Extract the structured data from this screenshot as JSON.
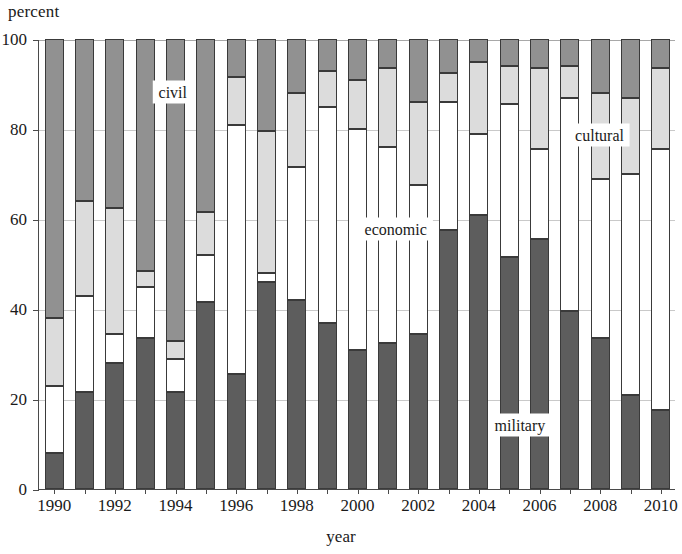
{
  "chart_data": {
    "type": "bar",
    "subtype": "stacked-bar-100-percent",
    "title": "",
    "xlabel": "year",
    "ylabel": "percent",
    "ylim": [
      0,
      100
    ],
    "yticks": [
      0,
      20,
      40,
      60,
      80,
      100
    ],
    "ytick_labels": [
      "0",
      "20",
      "40",
      "60",
      "80",
      "100"
    ],
    "grid": "horizontal",
    "legend_position": "in-plot annotations",
    "categories": [
      "1990",
      "1991",
      "1992",
      "1993",
      "1994",
      "1995",
      "1996",
      "1997",
      "1998",
      "1999",
      "2000",
      "2001",
      "2002",
      "2003",
      "2004",
      "2005",
      "2006",
      "2007",
      "2008",
      "2009",
      "2010"
    ],
    "xtick_labels": [
      "1990",
      "1992",
      "1994",
      "1996",
      "1998",
      "2000",
      "2002",
      "2004",
      "2006",
      "2008",
      "2010"
    ],
    "series": [
      {
        "name": "military",
        "color": "#5d5d5d",
        "values": [
          8,
          21.5,
          28,
          33.5,
          21.5,
          41.5,
          25.5,
          46,
          42,
          37,
          31,
          32.5,
          34.5,
          57.5,
          61,
          51.5,
          55.5,
          39.5,
          33.5,
          21,
          17.5
        ]
      },
      {
        "name": "economic",
        "color": "#ffffff",
        "values": [
          15,
          21.5,
          6.5,
          11.5,
          7.5,
          10.5,
          55.5,
          2,
          29.5,
          48,
          49,
          43.5,
          33,
          28.5,
          18,
          34,
          20,
          47.5,
          35.5,
          49,
          58
        ]
      },
      {
        "name": "cultural",
        "color": "#dcdcdc",
        "values": [
          15,
          21,
          28,
          3.5,
          4,
          9.5,
          10.5,
          31.5,
          16.5,
          8,
          11,
          17.5,
          18.5,
          6.5,
          16,
          8.5,
          18,
          7,
          19,
          17,
          18
        ]
      },
      {
        "name": "civil",
        "color": "#919191",
        "values": [
          62,
          36,
          37.5,
          51.5,
          67,
          38.5,
          8.5,
          20.5,
          12,
          7,
          9,
          6.5,
          14,
          7.5,
          5,
          6,
          6.5,
          6,
          12,
          13,
          6.5
        ]
      }
    ],
    "cumulative_tops": {
      "military": [
        8,
        21.5,
        28,
        33.5,
        21.5,
        41.5,
        25.5,
        46,
        42,
        37,
        31,
        32.5,
        34.5,
        57.5,
        61,
        51.5,
        55.5,
        39.5,
        33.5,
        21,
        17.5
      ],
      "economic": [
        23,
        43,
        34.5,
        45,
        29,
        52,
        81,
        48,
        71.5,
        85,
        80,
        76,
        67.5,
        86,
        79,
        85.5,
        75.5,
        87,
        69,
        70,
        75.5
      ],
      "cultural": [
        38,
        64,
        62.5,
        48.5,
        33,
        61.5,
        91.5,
        79.5,
        88,
        93,
        91,
        93.5,
        86,
        92.5,
        95,
        94,
        93.5,
        94,
        88,
        87,
        93.5
      ],
      "civil": [
        100,
        100,
        100,
        100,
        100,
        100,
        100,
        100,
        100,
        100,
        100,
        100,
        100,
        100,
        100,
        100,
        100,
        100,
        100,
        100,
        100
      ]
    },
    "annotations": [
      {
        "text": "civil",
        "x_percent": 21.0,
        "y_value": 88.5
      },
      {
        "text": "economic",
        "x_percent": 56.0,
        "y_value": 58.0
      },
      {
        "text": "cultural",
        "x_percent": 88.0,
        "y_value": 79.0
      },
      {
        "text": "military",
        "x_percent": 75.5,
        "y_value": 14.5
      }
    ]
  }
}
